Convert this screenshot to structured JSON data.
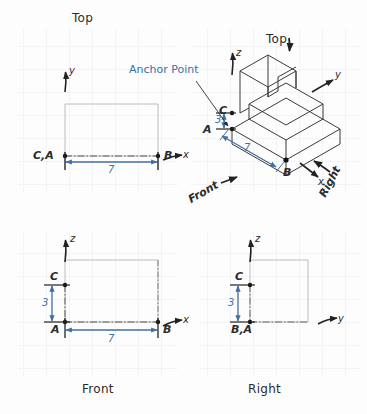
{
  "drawing": {
    "background_color": "#fdfdfd",
    "grid_color": "#e8eaec",
    "dim_color": "#3f6fa3",
    "line_color": "#3a3a3a",
    "hidden_line_color": "#9a9a9a"
  },
  "views": {
    "top": {
      "title": "Top",
      "axes": [
        {
          "name": "y",
          "label": "y"
        },
        {
          "name": "x",
          "label": "x"
        }
      ],
      "points": [
        {
          "id": "CA",
          "label": "C,A"
        },
        {
          "id": "B",
          "label": "B"
        }
      ],
      "dimensions": [
        {
          "id": "width",
          "label": "7",
          "orientation": "horizontal"
        }
      ]
    },
    "front": {
      "title": "Front",
      "axes": [
        {
          "name": "z",
          "label": "z"
        },
        {
          "name": "x",
          "label": "x"
        }
      ],
      "points": [
        {
          "id": "C",
          "label": "C"
        },
        {
          "id": "A",
          "label": "A"
        },
        {
          "id": "B",
          "label": "B"
        }
      ],
      "dimensions": [
        {
          "id": "height",
          "label": "3",
          "orientation": "vertical"
        },
        {
          "id": "width",
          "label": "7",
          "orientation": "horizontal"
        }
      ]
    },
    "right": {
      "title": "Right",
      "axes": [
        {
          "name": "z",
          "label": "z"
        },
        {
          "name": "y",
          "label": "y"
        }
      ],
      "points": [
        {
          "id": "C",
          "label": "C"
        },
        {
          "id": "BA",
          "label": "B,A"
        }
      ],
      "dimensions": [
        {
          "id": "height",
          "label": "3",
          "orientation": "vertical"
        }
      ]
    },
    "isometric": {
      "axes": [
        {
          "name": "z",
          "label": "z"
        },
        {
          "name": "y",
          "label": "y"
        },
        {
          "name": "x",
          "label": "x"
        }
      ],
      "points": [
        {
          "id": "C",
          "label": "C"
        },
        {
          "id": "A",
          "label": "A"
        },
        {
          "id": "B",
          "label": "B"
        }
      ],
      "dimensions": [
        {
          "id": "height",
          "label": "3",
          "orientation": "vertical"
        },
        {
          "id": "depth",
          "label": "7",
          "orientation": "diagonal"
        }
      ],
      "view_direction_labels": [
        {
          "id": "top",
          "label": "Top"
        },
        {
          "id": "front",
          "label": "Front"
        },
        {
          "id": "right",
          "label": "Right"
        }
      ]
    }
  },
  "annotations": {
    "anchor_point": {
      "label": "Anchor Point",
      "target_point": "A"
    }
  }
}
